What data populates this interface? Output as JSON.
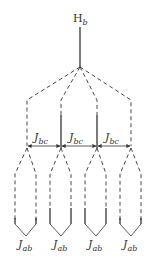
{
  "diagram": {
    "top_label": {
      "main": "H",
      "sub": "b"
    },
    "coupling_bc": {
      "main": "J",
      "sub": "bc"
    },
    "coupling_ab": {
      "main": "J",
      "sub": "ab"
    },
    "colors": {
      "line": "#333333",
      "background": "#ffffff"
    },
    "apex": {
      "x": 80,
      "y": 67
    },
    "top_stem": {
      "x": 80,
      "y1": 27,
      "y2": 67
    },
    "branches": [
      {
        "x": 27,
        "solid_upper": false,
        "left_x": 15,
        "right_x": 36
      },
      {
        "x": 61,
        "solid_upper": true,
        "left_x": 50,
        "right_x": 71
      },
      {
        "x": 97,
        "solid_upper": true,
        "left_x": 85,
        "right_x": 106
      },
      {
        "x": 131,
        "solid_upper": false,
        "left_x": 120,
        "right_x": 141
      }
    ],
    "bc_labels": [
      {
        "x": 44,
        "text_main": "J",
        "text_sub": "bc"
      },
      {
        "x": 79,
        "text_main": "J",
        "text_sub": "bc"
      },
      {
        "x": 114,
        "text_main": "J",
        "text_sub": "bc"
      }
    ],
    "ab_labels": [
      {
        "x": 26,
        "text_main": "J",
        "text_sub": "ab"
      },
      {
        "x": 61,
        "text_main": "J",
        "text_sub": "ab"
      },
      {
        "x": 96,
        "text_main": "J",
        "text_sub": "ab"
      },
      {
        "x": 131,
        "text_main": "J",
        "text_sub": "ab"
      }
    ]
  }
}
